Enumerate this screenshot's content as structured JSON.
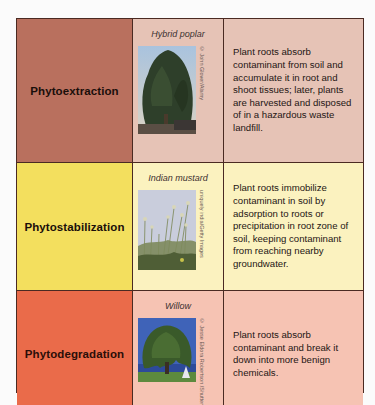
{
  "colors": {
    "border": "#4a2a22",
    "row1_name_bg": "#b9705e",
    "row1_bg": "#e6c3b6",
    "row2_name_bg": "#f3df5e",
    "row2_bg": "#fbf2bf",
    "row3_name_bg": "#ea6b4a",
    "row3_bg": "#f6c3b3"
  },
  "rows": [
    {
      "process": "Phytoextraction",
      "plant": "Hybrid poplar",
      "photo_icon": "poplar-tree-photo",
      "credit": "© John Glover/Alamy",
      "description": "Plant roots absorb contaminant from soil and accumulate it in root and shoot tissues; later, plants are harvested and disposed of in a hazardous waste landfill."
    },
    {
      "process": "Phytostabilization",
      "plant": "Indian mustard",
      "photo_icon": "mustard-plant-photo",
      "credit": "uniquely india/Getty Images",
      "description": "Plant roots immobilize contaminant in soil by adsorption to roots or precipitation in root zone of soil, keeping contaminant from reaching nearby groundwater."
    },
    {
      "process": "Phytodegradation",
      "plant": "Willow",
      "photo_icon": "willow-tree-photo",
      "credit": "© Jesse Eldora Robertson /Shutterstock",
      "description": "Plant roots absorb contaminant and break it down into more benign chemicals."
    }
  ]
}
